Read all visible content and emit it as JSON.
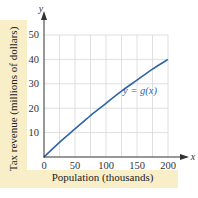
{
  "chart_data": {
    "type": "line",
    "title": "",
    "xlabel": "Population (thousands)",
    "ylabel": "Tax revenue (millions of dollars)",
    "x_axis_name": "x",
    "y_axis_name": "y",
    "xlim": [
      0,
      200
    ],
    "ylim": [
      0,
      50
    ],
    "x_ticks": [
      0,
      50,
      100,
      150,
      200
    ],
    "y_ticks": [
      10,
      20,
      30,
      40,
      50
    ],
    "x_grid_step": 25,
    "y_grid_step": 10,
    "grid": true,
    "series": [
      {
        "name": "y = g(x)",
        "color": "#2f64a8",
        "x": [
          0,
          25,
          50,
          75,
          100,
          125,
          150,
          175,
          200
        ],
        "y": [
          0,
          6,
          11.5,
          17,
          22,
          27,
          31.5,
          36,
          40
        ]
      }
    ],
    "annotations": [
      {
        "text": "y = g(x)",
        "x": 145,
        "y": 27
      }
    ]
  },
  "labels": {
    "xlabel": "Population (thousands)",
    "ylabel": "Tax revenue (millions of dollars)",
    "curve": "y = g(x)",
    "x_axis": "x",
    "y_axis": "y",
    "xt0": "0",
    "xt1": "50",
    "xt2": "100",
    "xt3": "150",
    "xt4": "200",
    "yt1": "10",
    "yt2": "20",
    "yt3": "30",
    "yt4": "40",
    "yt5": "50"
  },
  "colors": {
    "curve": "#2f64a8",
    "label_band": "#f8efc9",
    "grid": "#d8d8d8",
    "axis": "#333333"
  }
}
